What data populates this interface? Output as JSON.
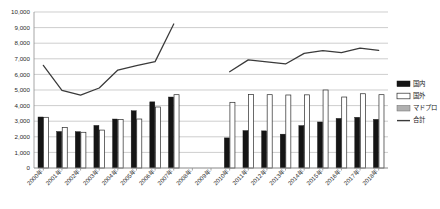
{
  "chart_data": {
    "type": "bar",
    "title": "",
    "subtitle": "",
    "xlabel": "",
    "ylabel": "",
    "ylim": [
      0,
      10000
    ],
    "ytick_step": 1000,
    "grid": true,
    "legend_position": "right",
    "categories": [
      "2000年",
      "2001年",
      "2002年",
      "2003年",
      "2004年",
      "2005年",
      "2006年",
      "2007年",
      "2008年",
      "2009年",
      "2010年",
      "2011年",
      "2012年",
      "2013年",
      "2014年",
      "2015年",
      "2016年",
      "2017年",
      "2018年"
    ],
    "ytick_labels": [
      "0",
      "1,000",
      "2,000",
      "3,000",
      "4,000",
      "5,000",
      "6,000",
      "7,000",
      "8,000",
      "9,000",
      "10,000"
    ],
    "ytick_values": [
      0,
      1000,
      2000,
      3000,
      4000,
      5000,
      6000,
      7000,
      8000,
      9000,
      10000
    ],
    "series": [
      {
        "name": "国内",
        "type": "bar",
        "color": "#151515",
        "values": [
          3270,
          2340,
          2330,
          2730,
          3140,
          3670,
          4240,
          4550,
          null,
          null,
          1930,
          2400,
          2380,
          2170,
          2720,
          2950,
          3180,
          3250,
          3120
        ]
      },
      {
        "name": "国外",
        "type": "bar",
        "color": "#ffffff",
        "values": [
          3250,
          2600,
          2290,
          2430,
          3110,
          3140,
          3910,
          4700,
          null,
          null,
          4210,
          4720,
          4700,
          4680,
          4690,
          5000,
          4550,
          4760,
          4700
        ]
      },
      {
        "name": "マドプロ",
        "type": "bar",
        "color": "#b0b0b0",
        "values": [
          null,
          null,
          null,
          null,
          null,
          null,
          null,
          null,
          null,
          null,
          null,
          null,
          null,
          null,
          null,
          null,
          null,
          null,
          null
        ]
      },
      {
        "name": "合計",
        "type": "line",
        "color": "#3a3a3a",
        "values": [
          6580,
          4980,
          4670,
          5130,
          6280,
          6560,
          6820,
          9230,
          null,
          null,
          6170,
          6930,
          6810,
          6670,
          7350,
          7520,
          7390,
          7680,
          7540
        ]
      }
    ]
  },
  "legend": {
    "items": [
      {
        "label": "国内",
        "marker": "filled-box"
      },
      {
        "label": "国外",
        "marker": "open-box"
      },
      {
        "label": "マドプロ",
        "marker": "gray-box"
      },
      {
        "label": "合計",
        "marker": "line"
      }
    ]
  }
}
